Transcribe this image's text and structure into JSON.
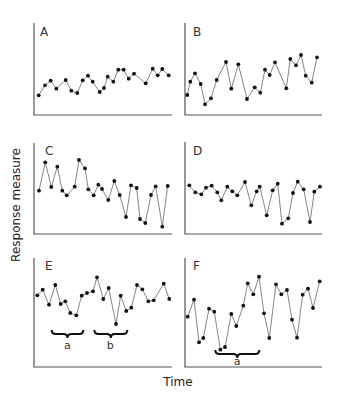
{
  "chart_data": [
    {
      "panel": "A",
      "type": "line",
      "title": "A",
      "xlabel": "Time",
      "ylabel": "Response measure",
      "axis": {
        "x0": 34,
        "x1": 172,
        "y_top": 23,
        "y_base": 115
      },
      "letter_pos": [
        40,
        36
      ],
      "points": [
        [
          38.7,
          95.3
        ],
        [
          45,
          85.3
        ],
        [
          50.7,
          80.7
        ],
        [
          56.3,
          88.7
        ],
        [
          65.7,
          80
        ],
        [
          71.3,
          90.7
        ],
        [
          77.3,
          93
        ],
        [
          82.7,
          80.3
        ],
        [
          88,
          75.7
        ],
        [
          92.7,
          81.7
        ],
        [
          99.7,
          92
        ],
        [
          104,
          88
        ],
        [
          107.7,
          76.7
        ],
        [
          113.3,
          81.7
        ],
        [
          118.3,
          69.7
        ],
        [
          123.7,
          69.7
        ],
        [
          128.7,
          78.7
        ],
        [
          134,
          73.7
        ],
        [
          145.7,
          83.3
        ],
        [
          152.7,
          68.7
        ],
        [
          157.7,
          75.3
        ],
        [
          162.3,
          69
        ],
        [
          168.7,
          75.3
        ]
      ],
      "braces": []
    },
    {
      "panel": "B",
      "type": "line",
      "title": "B",
      "xlabel": "Time",
      "ylabel": "Response measure",
      "axis": {
        "x0": 185,
        "x1": 322,
        "y_top": 23,
        "y_base": 115
      },
      "letter_pos": [
        193,
        36
      ],
      "points": [
        [
          187.3,
          95
        ],
        [
          190.3,
          81.7
        ],
        [
          195,
          73.3
        ],
        [
          200.7,
          84
        ],
        [
          205,
          104.3
        ],
        [
          211,
          98.3
        ],
        [
          216.7,
          80
        ],
        [
          226,
          62
        ],
        [
          231.3,
          88.7
        ],
        [
          238.3,
          64.3
        ],
        [
          247,
          99
        ],
        [
          254.7,
          87.3
        ],
        [
          260.3,
          92.7
        ],
        [
          265,
          69.7
        ],
        [
          269.7,
          75
        ],
        [
          275,
          62.3
        ],
        [
          286.3,
          88.3
        ],
        [
          290.3,
          59
        ],
        [
          296,
          65.3
        ],
        [
          301,
          55
        ],
        [
          305.7,
          75.7
        ],
        [
          311.7,
          82.7
        ],
        [
          317,
          57.3
        ]
      ],
      "braces": []
    },
    {
      "panel": "C",
      "type": "line",
      "title": "C",
      "xlabel": "Time",
      "ylabel": "Response measure",
      "axis": {
        "x0": 34,
        "x1": 172,
        "y_top": 143,
        "y_base": 234
      },
      "letter_pos": [
        45,
        155
      ],
      "points": [
        [
          39,
          190.7
        ],
        [
          45.3,
          162.3
        ],
        [
          51.3,
          187
        ],
        [
          57.3,
          166.7
        ],
        [
          62.3,
          190.7
        ],
        [
          66.7,
          195.3
        ],
        [
          74.7,
          186.7
        ],
        [
          79,
          160
        ],
        [
          85,
          168.3
        ],
        [
          88.3,
          189.3
        ],
        [
          93.7,
          195.3
        ],
        [
          98.3,
          184.7
        ],
        [
          102,
          189
        ],
        [
          108.3,
          200
        ],
        [
          114.3,
          181
        ],
        [
          119.7,
          195
        ],
        [
          126,
          217
        ],
        [
          131,
          185.3
        ],
        [
          136.7,
          188
        ],
        [
          140,
          219
        ],
        [
          145.3,
          223
        ],
        [
          151,
          195
        ],
        [
          155.7,
          186.3
        ],
        [
          162.3,
          226.7
        ],
        [
          167.7,
          186
        ]
      ],
      "braces": []
    },
    {
      "panel": "D",
      "type": "line",
      "title": "D",
      "xlabel": "Time",
      "ylabel": "Response measure",
      "axis": {
        "x0": 185,
        "x1": 322,
        "y_top": 142,
        "y_base": 234
      },
      "letter_pos": [
        193,
        155
      ],
      "points": [
        [
          189.3,
          185.3
        ],
        [
          195.3,
          192.3
        ],
        [
          201.3,
          194.3
        ],
        [
          206,
          187.7
        ],
        [
          211.7,
          185.7
        ],
        [
          217.3,
          192.3
        ],
        [
          221.3,
          200.3
        ],
        [
          227.3,
          186.7
        ],
        [
          232.3,
          191.3
        ],
        [
          237.3,
          195.3
        ],
        [
          245,
          182
        ],
        [
          251.3,
          205.3
        ],
        [
          256.7,
          191.3
        ],
        [
          259.7,
          186.7
        ],
        [
          266.7,
          215.3
        ],
        [
          272.7,
          190.3
        ],
        [
          277.7,
          183.7
        ],
        [
          282,
          223.7
        ],
        [
          288.3,
          218.3
        ],
        [
          293,
          193
        ],
        [
          297.7,
          181.7
        ],
        [
          303.7,
          189.3
        ],
        [
          310,
          222
        ],
        [
          314.3,
          191.7
        ],
        [
          320,
          186.7
        ]
      ],
      "braces": []
    },
    {
      "panel": "E",
      "type": "line",
      "title": "E",
      "xlabel": "Time",
      "ylabel": "Response measure",
      "axis": {
        "x0": 34,
        "x1": 172,
        "y_top": 258,
        "y_base": 367
      },
      "letter_pos": [
        45,
        270
      ],
      "points": [
        [
          37.3,
          295.3
        ],
        [
          42.7,
          289.7
        ],
        [
          49,
          304.7
        ],
        [
          55.3,
          285
        ],
        [
          60.7,
          304
        ],
        [
          65.3,
          301.3
        ],
        [
          70.3,
          313
        ],
        [
          76.3,
          315.3
        ],
        [
          81.7,
          295.7
        ],
        [
          87,
          293
        ],
        [
          93,
          291.3
        ],
        [
          97,
          277.3
        ],
        [
          103.3,
          299
        ],
        [
          108.7,
          288
        ],
        [
          116,
          324
        ],
        [
          120.7,
          295.7
        ],
        [
          126.3,
          311
        ],
        [
          131.3,
          307.7
        ],
        [
          137,
          285
        ],
        [
          142.3,
          289.3
        ],
        [
          148.3,
          301.3
        ],
        [
          153.7,
          300.3
        ],
        [
          163.7,
          283.7
        ],
        [
          169.3,
          299
        ]
      ],
      "braces": [
        {
          "label": "a",
          "x0": 51.7,
          "x1": 83.3,
          "y": 330,
          "label_x": 67.3,
          "label_y": 349
        },
        {
          "label": "b",
          "x0": 94.3,
          "x1": 127.3,
          "y": 330,
          "label_x": 110.3,
          "label_y": 349
        }
      ]
    },
    {
      "panel": "F",
      "type": "line",
      "title": "F",
      "xlabel": "Time",
      "ylabel": "Response measure",
      "axis": {
        "x0": 185,
        "x1": 322,
        "y_top": 258,
        "y_base": 367
      },
      "letter_pos": [
        193,
        270
      ],
      "points": [
        [
          187.7,
          316.7
        ],
        [
          194,
          299.7
        ],
        [
          199,
          342.3
        ],
        [
          203.3,
          338
        ],
        [
          209,
          308.7
        ],
        [
          214.3,
          311.7
        ],
        [
          220.3,
          349.7
        ],
        [
          225,
          347
        ],
        [
          231.3,
          314
        ],
        [
          236.3,
          326
        ],
        [
          243.3,
          305.7
        ],
        [
          247.7,
          283.3
        ],
        [
          253.3,
          294.3
        ],
        [
          259,
          276.7
        ],
        [
          264,
          313.3
        ],
        [
          269.3,
          338
        ],
        [
          276,
          284.3
        ],
        [
          281.3,
          294.3
        ],
        [
          287,
          290
        ],
        [
          292,
          319.7
        ],
        [
          297,
          337.7
        ],
        [
          302.7,
          294.7
        ],
        [
          308,
          288.7
        ],
        [
          313,
          308
        ],
        [
          319.7,
          281.3
        ]
      ],
      "braces": [
        {
          "label": "a",
          "x0": 215.3,
          "x1": 259.3,
          "y": 350,
          "label_x": 237,
          "label_y": 365
        }
      ]
    }
  ],
  "figure": {
    "ylabel": "Response measure",
    "xlabel": "Time",
    "ylabel_pos": [
      20,
      205
    ],
    "xlabel_pos": [
      178,
      386
    ]
  }
}
